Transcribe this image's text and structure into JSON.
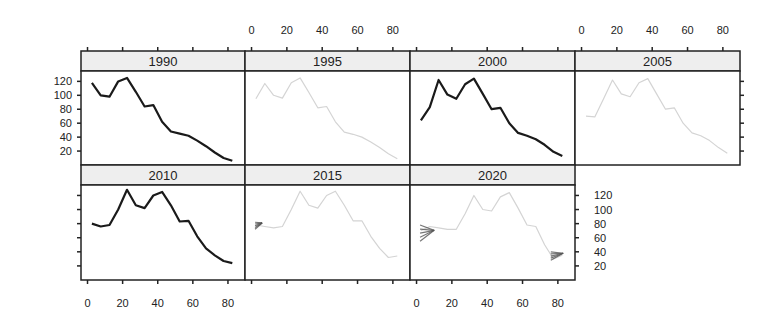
{
  "chart_data": {
    "type": "line",
    "layout": "trellis 4x2 (lattice xyplot), panels ordered left-to-right, top-to-bottom",
    "title": "",
    "xlabel": "",
    "ylabel": "",
    "xlim": [
      -2,
      88
    ],
    "ylim": [
      0,
      132
    ],
    "x_ticks": [
      0,
      20,
      40,
      60,
      80
    ],
    "y_ticks": [
      20,
      40,
      60,
      80,
      100,
      120
    ],
    "grid": false,
    "legend": null,
    "x": [
      2.5,
      7.5,
      12.5,
      17.5,
      22.5,
      27.5,
      32.5,
      37.5,
      42.5,
      47.5,
      52.5,
      57.5,
      62.5,
      67.5,
      72.5,
      77.5,
      82.5
    ],
    "panels": [
      {
        "label": "1990",
        "style": "observed-dark",
        "values": [
          118,
          100,
          98,
          120,
          125,
          105,
          84,
          86,
          62,
          48,
          45,
          42,
          35,
          27,
          18,
          10,
          6
        ]
      },
      {
        "label": "1995",
        "style": "projected-light",
        "values": [
          95,
          117,
          100,
          96,
          118,
          125,
          104,
          82,
          84,
          62,
          47,
          44,
          40,
          33,
          25,
          16,
          9
        ]
      },
      {
        "label": "2000",
        "style": "observed-dark",
        "values": [
          64,
          83,
          122,
          101,
          95,
          116,
          124,
          102,
          80,
          82,
          60,
          46,
          42,
          37,
          29,
          19,
          13
        ]
      },
      {
        "label": "2005",
        "style": "projected-light",
        "values": [
          70,
          69,
          95,
          122,
          102,
          98,
          118,
          124,
          102,
          80,
          82,
          60,
          46,
          42,
          35,
          25,
          17
        ]
      },
      {
        "label": "2010",
        "style": "observed-dark",
        "values": [
          80,
          76,
          78,
          100,
          128,
          106,
          102,
          120,
          125,
          106,
          83,
          84,
          62,
          45,
          35,
          27,
          24
        ]
      },
      {
        "label": "2015",
        "style": "projected-light",
        "values": [
          78,
          76,
          74,
          76,
          100,
          126,
          106,
          102,
          120,
          126,
          106,
          84,
          84,
          62,
          45,
          32,
          34
        ]
      },
      {
        "label": "2020",
        "style": "projected-light",
        "values": [
          70,
          76,
          74,
          72,
          72,
          94,
          120,
          100,
          98,
          118,
          124,
          102,
          78,
          76,
          50,
          30,
          35
        ]
      }
    ],
    "uncertainty_fans": [
      {
        "panel": "2015",
        "x_range": [
          2,
          6
        ],
        "y_range": [
          72,
          82
        ]
      },
      {
        "panel": "2020",
        "x_range": [
          2,
          10
        ],
        "y_range": [
          55,
          78
        ]
      },
      {
        "panel": "2020",
        "x_range": [
          76,
          83
        ],
        "y_range": [
          28,
          40
        ]
      }
    ]
  },
  "strips": [
    "1990",
    "1995",
    "2000",
    "2005",
    "2010",
    "2015",
    "2020"
  ],
  "axes": {
    "top_x_labels": [
      "0",
      "20",
      "40",
      "60",
      "80"
    ],
    "bottom_x_labels": [
      "0",
      "20",
      "40",
      "60",
      "80"
    ],
    "left_y_labels": [
      "120",
      "100",
      "80",
      "60",
      "40",
      "20"
    ],
    "right_y_labels": [
      "120",
      "100",
      "80",
      "60",
      "40",
      "20"
    ]
  },
  "colors": {
    "dark_line": "#1a1a1a",
    "light_line": "#d4d4d4",
    "strip_bg": "#eeeeee",
    "border": "#222222",
    "fan": "#555555"
  }
}
